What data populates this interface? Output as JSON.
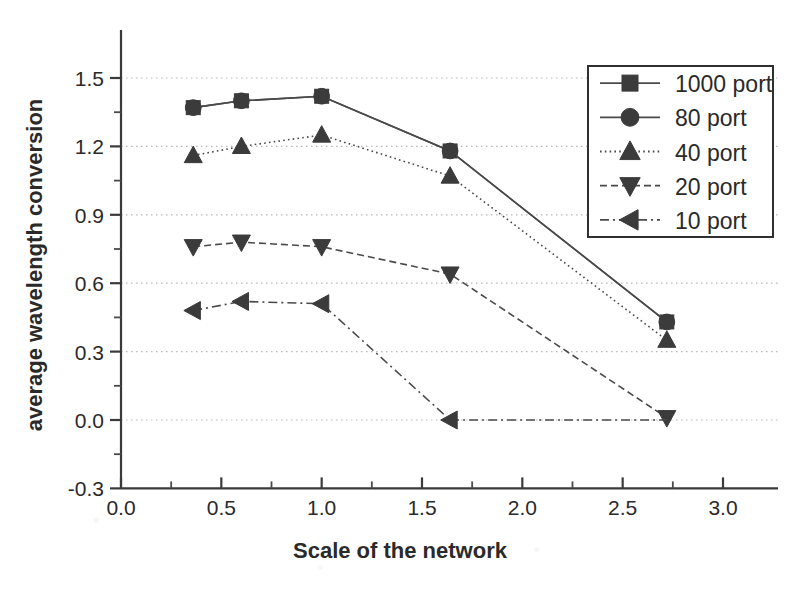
{
  "chart_data": {
    "type": "line",
    "title": "",
    "xlabel": "Scale of the network",
    "ylabel": "average wavelength conversion",
    "xlim": [
      0.0,
      3.0
    ],
    "ylim": [
      -0.3,
      1.65
    ],
    "grid": true,
    "legend_position": "top-right",
    "xticks": [
      "0.0",
      "0.5",
      "1.0",
      "1.5",
      "2.0",
      "2.5",
      "3.0"
    ],
    "xtick_values": [
      0.0,
      0.5,
      1.0,
      1.5,
      2.0,
      2.5,
      3.0
    ],
    "yticks": [
      "-0.3",
      "0.0",
      "0.3",
      "0.6",
      "0.9",
      "1.2",
      "1.5"
    ],
    "ytick_values": [
      -0.3,
      0.0,
      0.3,
      0.6,
      0.9,
      1.2,
      1.5
    ],
    "series": [
      {
        "name": "1000 port",
        "marker": "square",
        "linestyle": "solid",
        "x": [
          0.36,
          0.6,
          1.0,
          1.64,
          2.72
        ],
        "values": [
          1.37,
          1.4,
          1.42,
          1.18,
          0.43
        ]
      },
      {
        "name": "80 port",
        "marker": "circle",
        "linestyle": "solid",
        "x": [
          0.36,
          0.6,
          1.0,
          1.64,
          2.72
        ],
        "values": [
          1.37,
          1.4,
          1.42,
          1.18,
          0.43
        ]
      },
      {
        "name": "40 port",
        "marker": "triangle-up",
        "linestyle": "dotted",
        "x": [
          0.36,
          0.6,
          1.0,
          1.64,
          2.72
        ],
        "values": [
          1.16,
          1.2,
          1.25,
          1.07,
          0.35
        ]
      },
      {
        "name": "20 port",
        "marker": "triangle-down",
        "linestyle": "dashed",
        "x": [
          0.36,
          0.6,
          1.0,
          1.64,
          2.72
        ],
        "values": [
          0.76,
          0.78,
          0.76,
          0.64,
          0.01
        ]
      },
      {
        "name": "10 port",
        "marker": "triangle-left",
        "linestyle": "dashdot",
        "x": [
          0.36,
          0.6,
          1.0,
          1.64
        ],
        "values": [
          0.48,
          0.52,
          0.51,
          0.0
        ]
      }
    ]
  },
  "legend": {
    "entries": [
      {
        "label": "1000 port"
      },
      {
        "label": "80 port"
      },
      {
        "label": "40 port"
      },
      {
        "label": "20 port"
      },
      {
        "label": "10 port"
      }
    ]
  },
  "colors": {
    "axis": "#3a3a3a",
    "grid": "#b8b8b8",
    "marker": "#3b3b3b",
    "line": "#4a4a4a",
    "background": "#ffffff"
  }
}
